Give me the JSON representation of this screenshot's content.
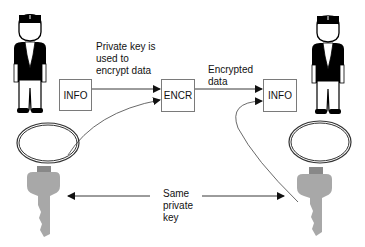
{
  "diagram": {
    "nodes": [
      {
        "id": "info_left",
        "label": "INFO"
      },
      {
        "id": "encr",
        "label": "ENCR"
      },
      {
        "id": "info_right",
        "label": "INFO"
      }
    ],
    "annotations": {
      "private_key_used": "Private key is\nused to\nencrypt data",
      "encrypted_data": "Encrypted\ndata",
      "same_private_key": "Same\nprivate\nkey"
    },
    "actors": [
      {
        "id": "sender",
        "icon": "person-icon"
      },
      {
        "id": "receiver",
        "icon": "person-icon"
      }
    ],
    "keys": [
      {
        "id": "sender_key",
        "icon": "key-icon"
      },
      {
        "id": "receiver_key",
        "icon": "key-icon"
      }
    ],
    "edges": [
      {
        "from": "info_left",
        "to": "encr"
      },
      {
        "from": "sender_key",
        "to": "encr"
      },
      {
        "from": "encr",
        "to": "info_right"
      },
      {
        "from": "receiver_key",
        "to": "info_right"
      },
      {
        "from": "sender_key",
        "to": "receiver_key",
        "bidirectional": true
      }
    ],
    "colors": {
      "line": "#222222",
      "box_border": "#7a7a7a",
      "key_fill": "#a8a8a8",
      "figure": "#000000"
    }
  }
}
